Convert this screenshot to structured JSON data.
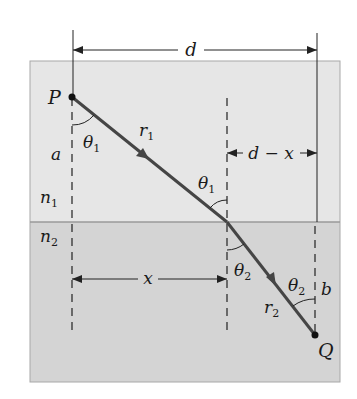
{
  "figure": {
    "type": "refraction-geometry",
    "colors": {
      "background": "#ffffff",
      "medium_1": "#e6e6e6",
      "medium_2": "#d4d4d4",
      "interface": "#9a9a9a",
      "box_border": "#a8a8a8",
      "ray": "#454545",
      "lines": "#222222"
    },
    "points": {
      "P": {
        "label": "P"
      },
      "Q": {
        "label": "Q"
      }
    },
    "media": {
      "upper": {
        "label": "n",
        "sub": "1"
      },
      "lower": {
        "label": "n",
        "sub": "2"
      }
    },
    "dimensions": {
      "d": {
        "label": "d"
      },
      "d_minus_x": {
        "label": "d − x"
      },
      "x": {
        "label": "x"
      },
      "a": {
        "label": "a"
      },
      "b": {
        "label": "b"
      }
    },
    "rays": {
      "r1": {
        "label": "r",
        "sub": "1"
      },
      "r2": {
        "label": "r",
        "sub": "2"
      }
    },
    "angles": {
      "theta1_at_P": {
        "label": "θ",
        "sub": "1"
      },
      "theta1_at_interface": {
        "label": "θ",
        "sub": "1"
      },
      "theta2_at_interface": {
        "label": "θ",
        "sub": "2"
      },
      "theta2_at_Q": {
        "label": "θ",
        "sub": "2"
      }
    }
  }
}
